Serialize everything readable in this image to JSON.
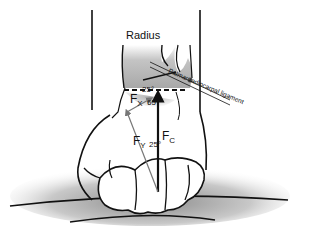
{
  "diagram": {
    "labels": {
      "radius": "Radius",
      "ligament": "Palmar radiocarpal ligament",
      "fx_main": "F",
      "fx_sub": "X",
      "fy_main": "F",
      "fy_sub": "Y",
      "fc_main": "F",
      "fc_sub": "C",
      "angle_top": "25°",
      "angle_mid": "65°",
      "angle_low": "25°"
    },
    "colors": {
      "outline": "#111111",
      "bone_shade": "#b8b8b8",
      "shadow": "#9a9a9a",
      "vector_grey": "#777777"
    }
  }
}
